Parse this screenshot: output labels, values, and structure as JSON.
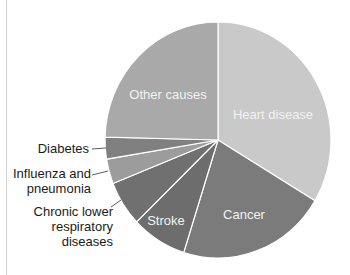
{
  "chart_data": {
    "type": "pie",
    "title": "",
    "start_angle_deg": 0,
    "direction": "clockwise",
    "legend": "none (labels on/near slices)",
    "slices": [
      {
        "label": "Heart disease",
        "value": 33.6,
        "color": "#c9c9c9",
        "label_inside": true
      },
      {
        "label": "Cancer",
        "value": 21.3,
        "color": "#7b7b7b",
        "label_inside": true
      },
      {
        "label": "Stroke",
        "value": 7.9,
        "color": "#6d6d6d",
        "label_inside": true
      },
      {
        "label": "Chronic lower respiratory diseases",
        "value": 6.2,
        "color": "#707070",
        "label_inside": false
      },
      {
        "label": "Influenza and pneumonia",
        "value": 3.4,
        "color": "#9c9c9c",
        "label_inside": false
      },
      {
        "label": "Diabetes",
        "value": 3.0,
        "color": "#808080",
        "label_inside": false
      },
      {
        "label": "Other causes",
        "value": 24.6,
        "color": "#a9a9a9",
        "label_inside": true
      }
    ],
    "units": "percent (estimated from slice angles)"
  },
  "labels": {
    "heart_disease": "Heart disease",
    "cancer": "Cancer",
    "stroke": "Stroke",
    "other_causes": "Other causes",
    "diabetes": "Diabetes",
    "influenza_line1": "Influenza and",
    "influenza_line2": "pneumonia",
    "chronic_line1": "Chronic lower",
    "chronic_line2": "respiratory",
    "chronic_line3": "diseases"
  }
}
